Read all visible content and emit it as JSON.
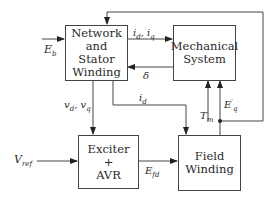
{
  "diagram": {
    "type": "block-diagram",
    "blocks": [
      {
        "id": "network",
        "lines": [
          "Network",
          "and",
          "Stator",
          "Winding"
        ]
      },
      {
        "id": "mechanical",
        "lines": [
          "Mechanical",
          "System"
        ]
      },
      {
        "id": "exciter",
        "lines": [
          "Exciter",
          "+",
          "AVR"
        ]
      },
      {
        "id": "field",
        "lines": [
          "Field",
          "Winding"
        ]
      }
    ],
    "signals": {
      "eb": {
        "base": "E",
        "sub": "b"
      },
      "idq": {
        "text": "i",
        "sub1": "d",
        "mid": ", i",
        "sub2": "q"
      },
      "delta": {
        "text": "δ"
      },
      "vdq": {
        "text": "v",
        "sub1": "d",
        "mid": ", v",
        "sub2": "q"
      },
      "id": {
        "base": "i",
        "sub": "d"
      },
      "tm": {
        "base": "T",
        "sub": "m"
      },
      "eq": {
        "base": "E",
        "sup": "′",
        "sub": "q"
      },
      "vref": {
        "base": "V",
        "sub": "ref"
      },
      "efd": {
        "base": "E",
        "sub": "fd"
      }
    },
    "connections": [
      {
        "from": "E_b",
        "to": "network"
      },
      {
        "from": "network",
        "to": "mechanical",
        "label": "i_d, i_q"
      },
      {
        "from": "mechanical",
        "to": "network",
        "label": "δ"
      },
      {
        "from": "network",
        "to": "exciter",
        "label": "v_d, v_q"
      },
      {
        "from": "network",
        "to": "field",
        "label": "i_d"
      },
      {
        "from": "T_m",
        "to": "mechanical"
      },
      {
        "from": "field",
        "to": "mechanical",
        "label": "E'_q"
      },
      {
        "from": "field",
        "to": "network",
        "label": "E'_q (feedback loop)"
      },
      {
        "from": "V_ref",
        "to": "exciter"
      },
      {
        "from": "exciter",
        "to": "field",
        "label": "E_fd"
      }
    ],
    "line_color": "#444444"
  }
}
